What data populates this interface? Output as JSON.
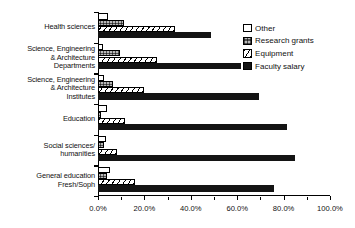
{
  "chart_data": {
    "type": "bar",
    "orientation": "horizontal",
    "title": "",
    "subtitle": "",
    "xlabel": "",
    "ylabel": "",
    "xlim": [
      0,
      100
    ],
    "xtick_labels": [
      "0.0%",
      "20.0%",
      "40.0%",
      "60.0%",
      "80.0%",
      "100.0%"
    ],
    "xtick_values": [
      0,
      20,
      40,
      60,
      80,
      100
    ],
    "xtick_minor_values": [
      10,
      30,
      50,
      70,
      90
    ],
    "grid": false,
    "legend_position": "upper right",
    "categories": [
      "Health sciences",
      "Science, Engineering\n& Architecture\nDepartments",
      "Science, Engineering\n& Architecture\nInstitutes",
      "Education",
      "Social sciences/\nhumanities",
      "General education\nFresh/Soph"
    ],
    "series": [
      {
        "name": "Other",
        "pattern": "white",
        "values": [
          4.5,
          2.0,
          2.5,
          4.0,
          3.5,
          5.0
        ]
      },
      {
        "name": "Research grants",
        "pattern": "stipple",
        "values": [
          11.0,
          9.5,
          6.5,
          1.5,
          2.5,
          4.0
        ]
      },
      {
        "name": "Equipment",
        "pattern": "diagonal-hatch",
        "values": [
          33.0,
          25.5,
          20.0,
          11.5,
          8.0,
          16.0
        ]
      },
      {
        "name": "Faculty salary",
        "pattern": "black",
        "values": [
          48.5,
          61.5,
          69.5,
          81.5,
          85.0,
          76.0
        ]
      }
    ]
  },
  "legend": {
    "items": [
      {
        "label": "Other"
      },
      {
        "label": "Research grants"
      },
      {
        "label": "Equipment"
      },
      {
        "label": "Faculty salary"
      }
    ]
  },
  "colors": {
    "axis": "#000000",
    "other": "#ffffff",
    "research_grants": "#b9b9b9",
    "equipment": "#ffffff",
    "faculty_salary": "#141414",
    "background": "#ffffff"
  }
}
